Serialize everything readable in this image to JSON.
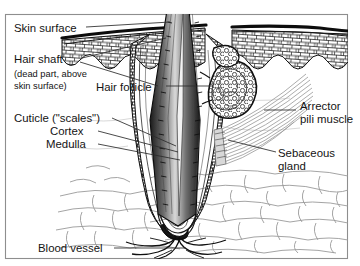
{
  "figure": {
    "labels": {
      "skin_surface": "Skin surface",
      "hair_shaft": "Hair shaft",
      "hair_shaft_note_line1": "(dead part, above",
      "hair_shaft_note_line2": "skin surface)",
      "hair_follicle": "Hair follicle",
      "cuticle": "Cuticle (\"scales\")",
      "cortex": "Cortex",
      "medulla": "Medulla",
      "arrector_line1": "Arrector",
      "arrector_line2": "pili muscle",
      "sebaceous_line1": "Sebaceous",
      "sebaceous_line2": "gland",
      "blood_vessel": "Blood vessel"
    },
    "colors": {
      "ink": "#141414",
      "leader": "#2b2b2b",
      "frame": "#8e8e8e",
      "fat_outline": "#9a9a9a",
      "muscle": "#9d9d9d",
      "background": "#ffffff"
    }
  }
}
